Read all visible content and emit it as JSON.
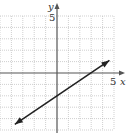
{
  "chart_data": {
    "type": "line",
    "title": "",
    "xlabel": "x",
    "ylabel": "y",
    "xlim": [
      -5,
      5
    ],
    "ylim": [
      -5,
      5
    ],
    "grid": true,
    "tick_labels": {
      "x": [
        "5"
      ],
      "y": [
        "5"
      ]
    },
    "series": [
      {
        "name": "line",
        "equation": "y = (2/3)x - 2",
        "x": [
          -3.7,
          0,
          3,
          4.6
        ],
        "y": [
          -4.5,
          -2,
          0,
          1.1
        ],
        "arrows": "both"
      }
    ]
  },
  "labels": {
    "x_axis": "x",
    "y_axis": "y",
    "x_tick": "5",
    "y_tick": "5"
  }
}
